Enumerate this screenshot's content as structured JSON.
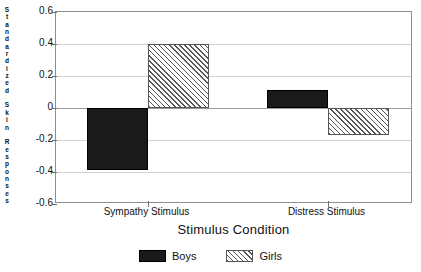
{
  "chart_data": {
    "type": "bar",
    "title": "",
    "xlabel": "Stimulus Condition",
    "ylabel": "Standardized Skin Responses",
    "ylabel_chars": [
      "S",
      "t",
      "a",
      "n",
      "d",
      "a",
      "r",
      "d",
      "i",
      "z",
      "e",
      "d",
      "",
      "S",
      "k",
      "i",
      "n",
      "",
      "R",
      "e",
      "s",
      "p",
      "o",
      "n",
      "s",
      "e",
      "s"
    ],
    "categories": [
      "Sympathy Stimulus",
      "Distress Stimulus"
    ],
    "series": [
      {
        "name": "Boys",
        "values": [
          -0.39,
          0.11
        ],
        "color": "#1a1a1a",
        "fill": "solid"
      },
      {
        "name": "Girls",
        "values": [
          0.4,
          -0.17
        ],
        "color": "#555555",
        "fill": "diagonal-hatch"
      }
    ],
    "ylim": [
      -0.6,
      0.6
    ],
    "yticks": [
      "0.6",
      "0.4",
      "0.2",
      "0",
      "-0.2",
      "-0.4",
      "-0.6"
    ],
    "ytick_values": [
      0.6,
      0.4,
      0.2,
      0,
      -0.2,
      -0.4,
      -0.6
    ],
    "grid": true,
    "grid_axis": "y",
    "legend_position": "bottom",
    "zero_line": 0
  },
  "legend": {
    "entries": [
      {
        "label": "Boys"
      },
      {
        "label": "Girls"
      }
    ]
  },
  "axes": {
    "x_title": "Stimulus Condition",
    "x_categories": [
      "Sympathy Stimulus",
      "Distress Stimulus"
    ]
  }
}
